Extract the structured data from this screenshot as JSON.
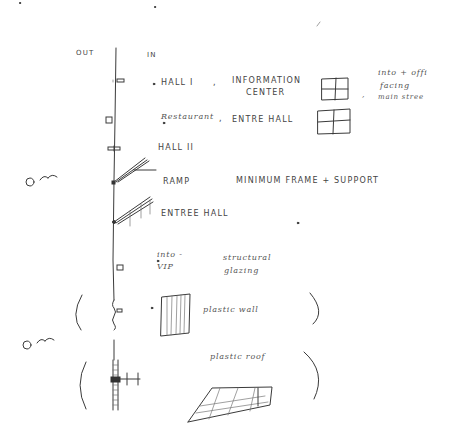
{
  "sketch": {
    "side_labels": {
      "out": "OUT",
      "in": "IN"
    },
    "rows": [
      {
        "left": "HALL I",
        "sep": ",",
        "middle_line1": "INFORMATION",
        "middle_line2": "CENTER",
        "note_sep": ",",
        "note": [
          "into + offi",
          "facing",
          "main stree"
        ]
      },
      {
        "left": "Restaurant",
        "sep": ",",
        "middle_line1": "ENTRE HALL"
      },
      {
        "left": "HALL II"
      },
      {
        "left": "RAMP",
        "middle_line1": "MINIMUM FRAME + SUPPORT"
      },
      {
        "left": "ENTREE HALL"
      },
      {
        "left_line1": "into -",
        "left_line2": "VIP",
        "middle_line1": "structural",
        "middle_line2": "glazing"
      },
      {
        "middle_line1": "plastic wall"
      },
      {
        "middle_line1": "plastic roof"
      }
    ]
  }
}
